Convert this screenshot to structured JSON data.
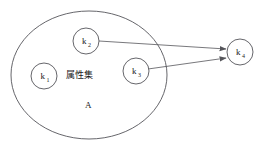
{
  "diagram": {
    "container": {
      "name": "attribute-set-ellipse",
      "label_cn": "属性集",
      "label_letter": "A",
      "cx": 89,
      "cy": 75,
      "rx": 78,
      "ry": 64
    },
    "nodes": [
      {
        "id": "k1",
        "label": "k",
        "sub": "1",
        "cx": 44,
        "cy": 76,
        "r": 13,
        "inside_set": true
      },
      {
        "id": "k2",
        "label": "k",
        "sub": "2",
        "cx": 86,
        "cy": 41,
        "r": 13,
        "inside_set": true
      },
      {
        "id": "k3",
        "label": "k",
        "sub": "3",
        "cx": 136,
        "cy": 71,
        "r": 13,
        "inside_set": true
      },
      {
        "id": "k4",
        "label": "k",
        "sub": "4",
        "cx": 240,
        "cy": 52,
        "r": 13,
        "inside_set": false
      }
    ],
    "edges": [
      {
        "id": "k2-to-k4",
        "from": "k2",
        "to": "k4",
        "x1": 99,
        "y1": 41,
        "x2": 226,
        "y2": 49
      },
      {
        "id": "k3-to-k4",
        "from": "k3",
        "to": "k4",
        "x1": 148,
        "y1": 69,
        "x2": 226,
        "y2": 58
      }
    ],
    "colors": {
      "stroke": "#55555a",
      "text": "#1b1b1b",
      "background": "#ffffff"
    }
  }
}
